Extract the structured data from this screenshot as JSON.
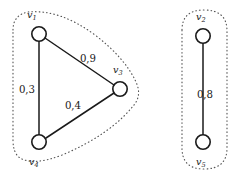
{
  "figure": {
    "width": 242,
    "height": 178,
    "background_color": "#ffffff",
    "node_fill_color": "#ffffff",
    "node_stroke_color": "#1a1a1a",
    "edge_color": "#1a1a1a",
    "cluster_outline_color": "#555555",
    "label_color": "#1a1a1a"
  },
  "nodes": [
    {
      "id": "v1",
      "base": "v",
      "sub": "1",
      "cx": 39,
      "cy": 34,
      "r": 7.2,
      "label_x": 27,
      "label_y": 18,
      "label_anchor": "start"
    },
    {
      "id": "v3",
      "base": "v",
      "sub": "3",
      "cx": 120,
      "cy": 89,
      "r": 7.2,
      "label_x": 113,
      "label_y": 73,
      "label_anchor": "start"
    },
    {
      "id": "v4",
      "base": "v",
      "sub": "4",
      "cx": 39,
      "cy": 142,
      "r": 7.2,
      "label_x": 29,
      "label_y": 165,
      "label_anchor": "start"
    },
    {
      "id": "v2",
      "base": "v",
      "sub": "2",
      "cx": 203,
      "cy": 36,
      "r": 7.2,
      "label_x": 196,
      "label_y": 20,
      "label_anchor": "start"
    },
    {
      "id": "v5",
      "base": "v",
      "sub": "5",
      "cx": 203,
      "cy": 142,
      "r": 7.2,
      "label_x": 196,
      "label_y": 165,
      "label_anchor": "start"
    }
  ],
  "edges": [
    {
      "id": "e-v1-v3",
      "source": "v1",
      "target": "v3",
      "weight": "0,9",
      "x1": 45,
      "y1": 38,
      "x2": 114,
      "y2": 85,
      "label_x": 88,
      "label_y": 62
    },
    {
      "id": "e-v1-v4",
      "source": "v1",
      "target": "v4",
      "weight": "0,3",
      "x1": 39,
      "y1": 41,
      "x2": 39,
      "y2": 135,
      "label_x": 27,
      "label_y": 93
    },
    {
      "id": "e-v3-v4",
      "source": "v3",
      "target": "v4",
      "weight": "0,4",
      "x1": 114,
      "y1": 93,
      "x2": 46,
      "y2": 138,
      "label_x": 73,
      "label_y": 109
    },
    {
      "id": "e-v2-v5",
      "source": "v2",
      "target": "v5",
      "weight": "0,8",
      "x1": 203,
      "y1": 43,
      "x2": 203,
      "y2": 135,
      "label_x": 205,
      "label_y": 98
    }
  ],
  "clusters": [
    {
      "id": "cluster-left",
      "members": [
        "v1",
        "v3",
        "v4"
      ],
      "path": "M 13 30 Q 13 15 28 12 Q 60 9 95 35 Q 125 58 136 82 Q 142 95 134 105 Q 110 135 62 155 Q 34 166 20 158 Q 13 153 13 140 Z"
    },
    {
      "id": "cluster-right",
      "members": [
        "v2",
        "v5"
      ],
      "path": "M 182 30 Q 182 10 204 10 Q 227 10 227 31 L 227 148 Q 227 169 204 169 Q 182 169 182 148 Z"
    }
  ]
}
